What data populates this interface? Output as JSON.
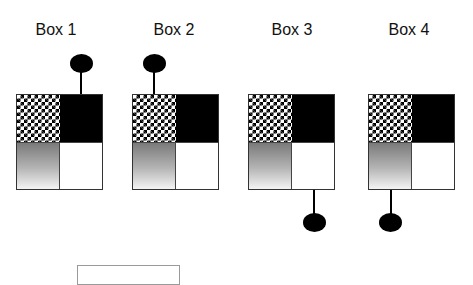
{
  "diagram": {
    "boxes": [
      {
        "label": "Box 1",
        "cells": [
          "checkerboard",
          "black",
          "gradient",
          "white"
        ],
        "lollipop": {
          "side": "top",
          "quadrant": "top-right"
        }
      },
      {
        "label": "Box 2",
        "cells": [
          "checkerboard",
          "black",
          "gradient",
          "white"
        ],
        "lollipop": {
          "side": "top",
          "quadrant": "top-left"
        }
      },
      {
        "label": "Box 3",
        "cells": [
          "checkerboard",
          "black",
          "gradient",
          "white"
        ],
        "lollipop": {
          "side": "bottom",
          "quadrant": "bottom-right"
        }
      },
      {
        "label": "Box 4",
        "cells": [
          "checkerboard",
          "black",
          "gradient",
          "white"
        ],
        "lollipop": {
          "side": "bottom",
          "quadrant": "bottom-left"
        }
      }
    ],
    "colors": {
      "stroke": "#000000",
      "border": "#333333",
      "gradient_top": "#7a7a7a",
      "gradient_bottom": "#f4f4f4"
    }
  }
}
